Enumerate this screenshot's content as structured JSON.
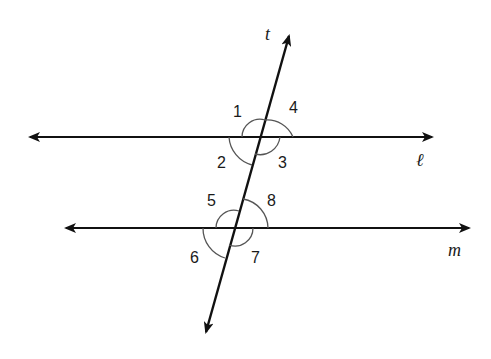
{
  "diagram": {
    "lines": {
      "l": {
        "label": "ℓ"
      },
      "m": {
        "label": "m"
      },
      "t": {
        "label": "t"
      }
    },
    "angles": [
      {
        "id": 1,
        "label": "1"
      },
      {
        "id": 2,
        "label": "2"
      },
      {
        "id": 3,
        "label": "3"
      },
      {
        "id": 4,
        "label": "4"
      },
      {
        "id": 5,
        "label": "5"
      },
      {
        "id": 6,
        "label": "6"
      },
      {
        "id": 7,
        "label": "7"
      },
      {
        "id": 8,
        "label": "8"
      }
    ],
    "colors": {
      "stroke": "#111111",
      "arc": "#555555"
    }
  }
}
